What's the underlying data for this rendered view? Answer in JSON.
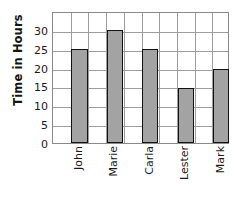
{
  "chart_data": {
    "type": "bar",
    "title": "",
    "xlabel": "",
    "ylabel": "Time in Hours",
    "categories": [
      "John",
      "Marie",
      "Carla",
      "Lester",
      "Mark"
    ],
    "values": [
      25,
      30,
      25,
      14.5,
      19.5
    ],
    "ylim": [
      0,
      35
    ],
    "ytick_labels": [
      "0",
      "5",
      "10",
      "15",
      "20",
      "25",
      "30"
    ],
    "ytick_values": [
      0,
      5,
      10,
      15,
      20,
      25,
      30
    ],
    "ytick_step": 5,
    "grid": true,
    "grid_axis": "both",
    "legend": "none",
    "bar_fill_color": "#a3a3a3",
    "bar_edge_color": "#121212",
    "grid_color": "#9d9d9d",
    "plot_border_color": "#8a8a8a",
    "background_color": "#ffffff",
    "xtick_rotation": 90
  }
}
